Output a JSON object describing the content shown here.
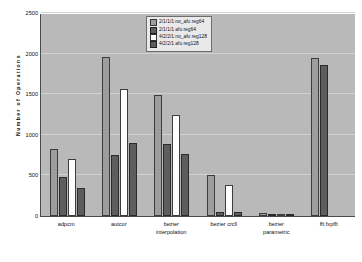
{
  "chart_data": {
    "type": "bar",
    "title": "",
    "xlabel": "",
    "ylabel": "Number of Operations",
    "ylim": [
      0,
      2500
    ],
    "yticks": [
      0,
      500,
      1000,
      1500,
      2000,
      2500
    ],
    "ytick_labels": [
      "0",
      "500",
      "1000",
      "1500",
      "2000",
      "2500"
    ],
    "grid": true,
    "legend_position": "top-center",
    "categories": [
      "adpcm",
      "autcor",
      "bezier interpolation",
      "bezier crcll",
      "bezier parametric",
      "fft fxpfft"
    ],
    "category_lines": [
      [
        "adpcm"
      ],
      [
        "autcor"
      ],
      [
        "bezier",
        "interpolation"
      ],
      [
        "bezier crcll"
      ],
      [
        "bezier",
        "parametric"
      ],
      [
        "fft fxpfft"
      ]
    ],
    "series": [
      {
        "name": "2/1/1/1 no_afu reg64",
        "color": "#9d9d9d",
        "values": [
          830,
          1955,
          1485,
          510,
          35,
          1945
        ]
      },
      {
        "name": "2/1/1/1 afu reg64",
        "color": "#5d5d5d",
        "values": [
          485,
          750,
          885,
          50,
          8,
          1860
        ]
      },
      {
        "name": "4/2/2/1 no_afu reg128",
        "color": "#fdfdfd",
        "values": [
          700,
          1560,
          1250,
          385,
          30,
          null
        ]
      },
      {
        "name": "4/2/2/1 afu reg128",
        "color": "#5d5d5d",
        "values": [
          350,
          895,
          760,
          55,
          10,
          null
        ]
      }
    ]
  }
}
